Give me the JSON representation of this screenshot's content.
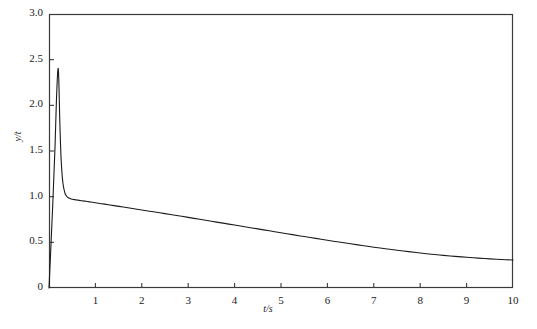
{
  "chart_data": {
    "type": "line",
    "title": "",
    "subtitle": "",
    "xlabel": "t/s",
    "ylabel": "y/t",
    "xlim": [
      0,
      10
    ],
    "ylim": [
      0,
      3.0
    ],
    "grid": false,
    "legend": null,
    "x_ticks": [
      {
        "value": 0,
        "label": ""
      },
      {
        "value": 1,
        "label": "1"
      },
      {
        "value": 2,
        "label": "2"
      },
      {
        "value": 3,
        "label": "3"
      },
      {
        "value": 4,
        "label": "4"
      },
      {
        "value": 5,
        "label": "5"
      },
      {
        "value": 6,
        "label": "6"
      },
      {
        "value": 7,
        "label": "7"
      },
      {
        "value": 8,
        "label": "8"
      },
      {
        "value": 9,
        "label": "9"
      },
      {
        "value": 10,
        "label": "10"
      }
    ],
    "y_ticks": [
      {
        "value": 0,
        "label": "0"
      },
      {
        "value": 0.5,
        "label": "0.5"
      },
      {
        "value": 1.0,
        "label": "1.0"
      },
      {
        "value": 1.5,
        "label": "1.5"
      },
      {
        "value": 2.0,
        "label": "2.0"
      },
      {
        "value": 2.5,
        "label": "2.5"
      },
      {
        "value": 3.0,
        "label": "3.0"
      }
    ],
    "series": [
      {
        "name": "y/t",
        "color": "#1a1a1a",
        "x": [
          0.0,
          0.08,
          0.13,
          0.16,
          0.18,
          0.19,
          0.2,
          0.21,
          0.22,
          0.23,
          0.25,
          0.27,
          0.3,
          0.34,
          0.38,
          0.43,
          0.48,
          0.55,
          0.62,
          0.7,
          0.8,
          0.9,
          1.0,
          1.2,
          1.4,
          1.6,
          1.8,
          2.0,
          2.25,
          2.5,
          2.75,
          3.0,
          3.25,
          3.5,
          3.75,
          4.0,
          4.25,
          4.5,
          4.75,
          5.0,
          5.25,
          5.5,
          5.75,
          6.0,
          6.25,
          6.5,
          6.75,
          7.0,
          7.25,
          7.5,
          7.75,
          8.0,
          8.25,
          8.5,
          8.75,
          9.0,
          9.25,
          9.5,
          9.75,
          10.0
        ],
        "y": [
          0.0,
          0.9,
          1.55,
          2.05,
          2.3,
          2.38,
          2.4,
          2.3,
          2.1,
          1.88,
          1.55,
          1.33,
          1.15,
          1.045,
          1.005,
          0.985,
          0.975,
          0.968,
          0.962,
          0.956,
          0.949,
          0.941,
          0.933,
          0.918,
          0.902,
          0.886,
          0.87,
          0.854,
          0.834,
          0.814,
          0.794,
          0.773,
          0.752,
          0.731,
          0.71,
          0.689,
          0.668,
          0.647,
          0.626,
          0.605,
          0.584,
          0.563,
          0.543,
          0.523,
          0.503,
          0.484,
          0.465,
          0.447,
          0.43,
          0.413,
          0.398,
          0.383,
          0.37,
          0.357,
          0.346,
          0.336,
          0.327,
          0.319,
          0.312,
          0.306
        ]
      }
    ],
    "annotations": []
  },
  "figure": {
    "background_color": "#ffffff",
    "frame_color": "#3a3a3a",
    "curve_color": "#1a1a1a",
    "plot_left_px": 49,
    "plot_right_px": 513,
    "plot_top_px": 14,
    "plot_bottom_px": 288
  }
}
